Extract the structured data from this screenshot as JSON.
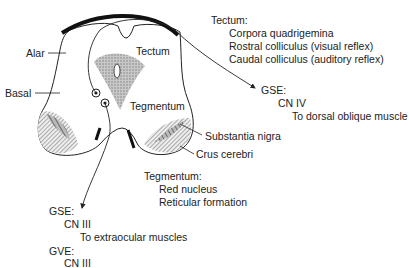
{
  "diagram": {
    "labels": {
      "alar": "Alar",
      "basal": "Basal",
      "tectum": "Tectum",
      "tegmentum": "Tegmentum",
      "substantia_nigra": "Substantia nigra",
      "crus_cerebri": "Crus cerebri"
    },
    "tectum_note": {
      "heading": "Tectum:",
      "lines": [
        "Corpora quadrigemina",
        "Rostral colliculus (visual reflex)",
        "Caudal colliculus (auditory reflex)"
      ]
    },
    "gse_cn4": {
      "heading": "GSE:",
      "nerve": "CN IV",
      "target": "To dorsal oblique muscle"
    },
    "tegmentum_note": {
      "heading": "Tegmentum:",
      "lines": [
        "Red nucleus",
        "Reticular formation"
      ]
    },
    "gse_cn3": {
      "heading": "GSE:",
      "nerve": "CN III",
      "target": "To extraocular muscles"
    },
    "gve_cn3": {
      "heading": "GVE:",
      "nerve": "CN III"
    }
  }
}
